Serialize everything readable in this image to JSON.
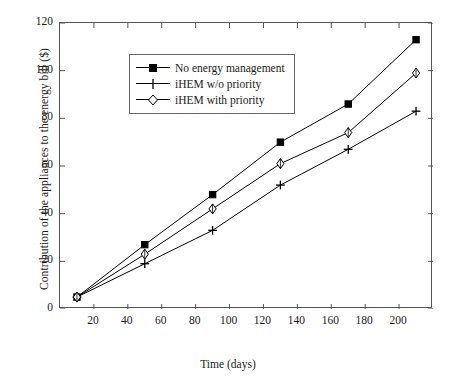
{
  "chart_data": {
    "type": "line",
    "title": "",
    "xlabel": "Time (days)",
    "ylabel": "Contribution of the appliances to the energy bill ($)",
    "xlim": [
      0,
      220
    ],
    "ylim": [
      0,
      120
    ],
    "xticks": [
      20,
      40,
      60,
      80,
      100,
      120,
      140,
      160,
      180,
      200
    ],
    "yticks": [
      0,
      20,
      40,
      60,
      80,
      100,
      120
    ],
    "grid": false,
    "legend_position": "upper left",
    "x": [
      10,
      50,
      90,
      130,
      170,
      210
    ],
    "series": [
      {
        "name": "No energy management",
        "marker": "filled-square",
        "values": [
          5,
          27,
          48,
          70,
          86,
          113
        ]
      },
      {
        "name": "iHEM w/o priority",
        "marker": "plus",
        "values": [
          5,
          19,
          33,
          52,
          67,
          83
        ]
      },
      {
        "name": "iHEM with priority",
        "marker": "open-diamond",
        "values": [
          5,
          23,
          42,
          61,
          74,
          99
        ]
      }
    ],
    "colors": {
      "line": "#000000",
      "axis": "#555555",
      "background": "#ffffff"
    }
  },
  "legend": {
    "items": [
      {
        "label": "No energy management",
        "marker": "filled-square"
      },
      {
        "label": "iHEM w/o priority",
        "marker": "plus"
      },
      {
        "label": "iHEM with priority",
        "marker": "open-diamond"
      }
    ]
  },
  "axes": {
    "x_title": "Time (days)",
    "y_title": "Contribution of the appliances to the energy bill ($)",
    "x_tick_labels": [
      "20",
      "40",
      "60",
      "80",
      "100",
      "120",
      "140",
      "160",
      "180",
      "200"
    ],
    "y_tick_labels": [
      "0",
      "20",
      "40",
      "60",
      "80",
      "100",
      "120"
    ]
  }
}
